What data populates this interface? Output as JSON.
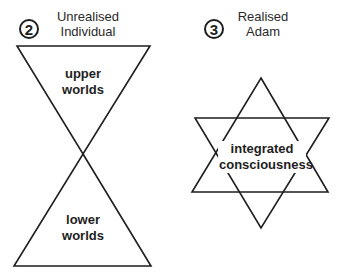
{
  "panels": [
    {
      "number": "2",
      "title_lines": [
        "Unrealised",
        "Individual"
      ],
      "shape": "hourglass",
      "labels": {
        "upper": [
          "upper",
          "worlds"
        ],
        "lower": [
          "lower",
          "worlds"
        ]
      }
    },
    {
      "number": "3",
      "title_lines": [
        "Realised",
        "Adam"
      ],
      "shape": "hexagram",
      "labels": {
        "center": [
          "integrated",
          "consciousness"
        ]
      }
    }
  ],
  "colors": {
    "stroke": "#1e1e1e",
    "background": "#ffffff"
  }
}
